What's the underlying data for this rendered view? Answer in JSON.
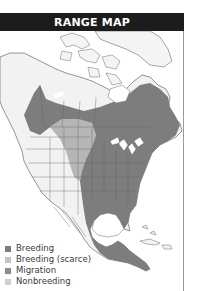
{
  "title": "RANGE MAP",
  "colors": {
    "title_bar": "#1c1c1c",
    "breeding": "#7d7d7d",
    "breeding_scarce": "#b4b4b4",
    "migration": "#8f8f8f",
    "nonbreeding": "#c8c8c8",
    "land_outside_range": "#f2f2f2",
    "border_lines": "#6a6a6a"
  },
  "legend": [
    {
      "label": "Breeding",
      "color": "#7d7d7d"
    },
    {
      "label": "Breeding (scarce)",
      "color": "#c4c4c4"
    },
    {
      "label": "Migration",
      "color": "#8a8a8a"
    },
    {
      "label": "Nonbreeding",
      "color": "#cfcfcf"
    }
  ]
}
